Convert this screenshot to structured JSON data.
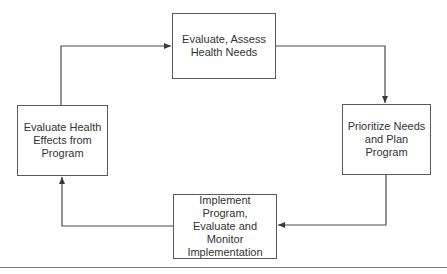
{
  "diagram": {
    "type": "cycle-flowchart",
    "nodes": [
      {
        "id": "assess",
        "label": "Evaluate, Assess Health Needs",
        "lines": [
          "Evaluate, Assess",
          "Health Needs"
        ]
      },
      {
        "id": "prioritize",
        "label": "Prioritize Needs and Plan Program",
        "lines": [
          "Prioritize Needs",
          "and Plan Program"
        ]
      },
      {
        "id": "implement",
        "label": "Implement Program, Evaluate and Monitor Implementation",
        "lines": [
          "Implement Program,",
          "Evaluate and Monitor",
          "Implementation"
        ]
      },
      {
        "id": "evaluate",
        "label": "Evaluate Health Effects from Program",
        "lines": [
          "Evaluate Health",
          "Effects from",
          "Program"
        ]
      }
    ],
    "edges": [
      {
        "from": "assess",
        "to": "prioritize"
      },
      {
        "from": "prioritize",
        "to": "implement"
      },
      {
        "from": "implement",
        "to": "evaluate"
      },
      {
        "from": "evaluate",
        "to": "assess"
      }
    ],
    "colors": {
      "line": "#4a4a4a",
      "box_border": "#5a5a5a",
      "text": "#333333",
      "rule": "#7a7a7a"
    }
  }
}
